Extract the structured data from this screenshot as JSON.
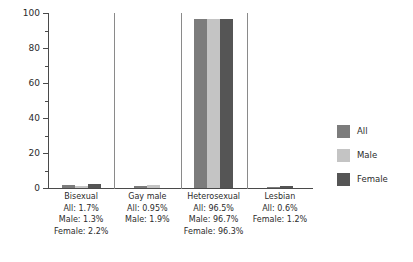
{
  "chart_data": {
    "type": "bar",
    "title": "",
    "xlabel": "",
    "ylabel": "",
    "ylim": [
      0,
      100
    ],
    "y_major_ticks": [
      0,
      20,
      40,
      60,
      80,
      100
    ],
    "y_minor_ticks": [
      10,
      30,
      50,
      70,
      90
    ],
    "y_tick_labels": [
      "0",
      "20",
      "40",
      "60",
      "80",
      "100"
    ],
    "grid": false,
    "legend_position": "right",
    "categories": [
      "Bisexual",
      "Gay male",
      "Heterosexual",
      "Lesbian"
    ],
    "series": [
      {
        "name": "All",
        "color": "#7c7c7c",
        "values": [
          1.7,
          0.95,
          96.5,
          0.6
        ]
      },
      {
        "name": "Male",
        "color": "#c4c4c4",
        "values": [
          1.3,
          1.9,
          96.7,
          null
        ]
      },
      {
        "name": "Female",
        "color": "#555555",
        "values": [
          2.2,
          null,
          96.3,
          1.2
        ]
      }
    ],
    "group_annotations": [
      {
        "name": "Bisexual",
        "lines": [
          "Bisexual",
          "All: 1.7%",
          "Male: 1.3%",
          "Female: 2.2%"
        ]
      },
      {
        "name": "Gay male",
        "lines": [
          "Gay male",
          "All: 0.95%",
          "Male: 1.9%"
        ]
      },
      {
        "name": "Heterosexual",
        "lines": [
          "Heterosexual",
          "All: 96.5%",
          "Male: 96.7%",
          "Female: 96.3%"
        ]
      },
      {
        "name": "Lesbian",
        "lines": [
          "Lesbian",
          "All: 0.6%",
          "Female: 1.2%"
        ]
      }
    ]
  },
  "legend": {
    "items": [
      {
        "label": "All",
        "color": "#7c7c7c"
      },
      {
        "label": "Male",
        "color": "#c4c4c4"
      },
      {
        "label": "Female",
        "color": "#555555"
      }
    ]
  },
  "axis": {
    "line_color": "#4a4a4a",
    "separator_color": "#8a8a8a"
  }
}
